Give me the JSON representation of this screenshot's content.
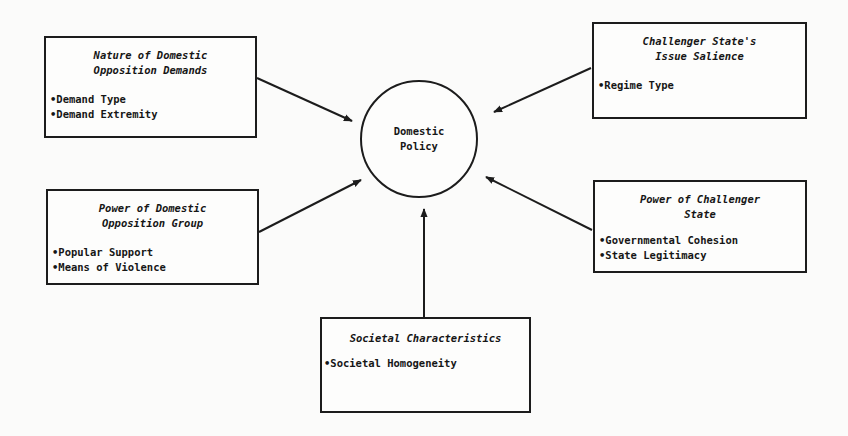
{
  "diagram": {
    "center": {
      "label": "Domestic\nPolicy"
    },
    "factors": [
      {
        "id": "nature-demands",
        "title": "Nature of Domestic\nOpposition Demands",
        "items": [
          "Demand Type",
          "Demand Extremity"
        ]
      },
      {
        "id": "issue-salience",
        "title": "Challenger State's\nIssue Salience",
        "items": [
          "Regime Type"
        ]
      },
      {
        "id": "power-opposition",
        "title": "Power of Domestic\nOpposition Group",
        "items": [
          "Popular Support",
          "Means of Violence"
        ]
      },
      {
        "id": "power-challenger",
        "title": "Power of Challenger\nState",
        "items": [
          "Governmental Cohesion",
          "State Legitimacy"
        ]
      },
      {
        "id": "societal",
        "title": "Societal Characteristics",
        "items": [
          "Societal Homogeneity"
        ]
      }
    ],
    "edges": [
      {
        "from": "nature-demands",
        "to": "center"
      },
      {
        "from": "issue-salience",
        "to": "center"
      },
      {
        "from": "power-opposition",
        "to": "center"
      },
      {
        "from": "power-challenger",
        "to": "center"
      },
      {
        "from": "societal",
        "to": "center"
      }
    ],
    "colors": {
      "line": "#1c1c1c",
      "background": "#fbfbfa"
    }
  }
}
